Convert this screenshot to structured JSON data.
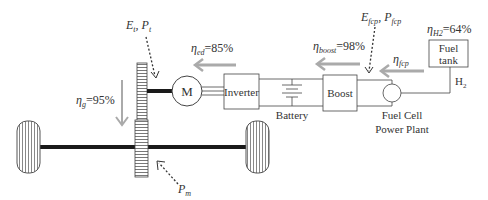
{
  "diagram": {
    "type": "fuel-cell-vehicle-powertrain",
    "colors": {
      "line": "#444444",
      "shaft": "#1a1a1a",
      "flow_arrow": "#aaaaaa",
      "text": "#333333"
    },
    "components": {
      "motor": {
        "label": "M"
      },
      "inverter": {
        "label": "Inverter"
      },
      "battery": {
        "label": "Battery"
      },
      "boost": {
        "label": "Boost"
      },
      "fuel_cell": {
        "label_line1": "Fuel Cell",
        "label_line2": "Power Plant"
      },
      "fuel_tank": {
        "label_line1": "Fuel",
        "label_line2": "tank"
      },
      "h2_line": {
        "label": "H",
        "sub": "2"
      }
    },
    "annotations": {
      "traction": {
        "e": "E",
        "e_sub": "t",
        "sep": ", ",
        "p": "P",
        "p_sub": "t"
      },
      "fcp": {
        "e": "E",
        "e_sub": "fcp",
        "sep": ", ",
        "p": "P",
        "p_sub": "fcp"
      },
      "mech": {
        "p": "P",
        "p_sub": "m"
      }
    },
    "efficiencies": {
      "ed": {
        "symbol": "η",
        "sub": "ed",
        "value": "=85%"
      },
      "boost": {
        "symbol": "η",
        "sub": "boost",
        "value": "=98%"
      },
      "fcp": {
        "symbol": "η",
        "sub": "fcp"
      },
      "h2": {
        "symbol": "η",
        "sub": "H2",
        "value": "=64%"
      },
      "gear": {
        "symbol": "η",
        "sub": "g",
        "value": "=95%"
      }
    }
  }
}
